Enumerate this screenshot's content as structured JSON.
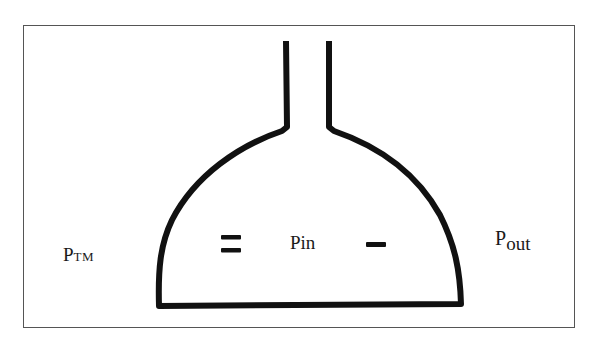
{
  "diagram": {
    "type": "pressure-vessel-schematic",
    "colors": {
      "stroke": "#111111",
      "frame": "#555555",
      "background": "#ffffff"
    },
    "labels": {
      "ptm": {
        "main": "P",
        "sub": "TM"
      },
      "pin": "Pin",
      "pout": {
        "main": "P",
        "sub": "out"
      }
    },
    "symbols": {
      "equals": "=",
      "minus": "−"
    }
  }
}
